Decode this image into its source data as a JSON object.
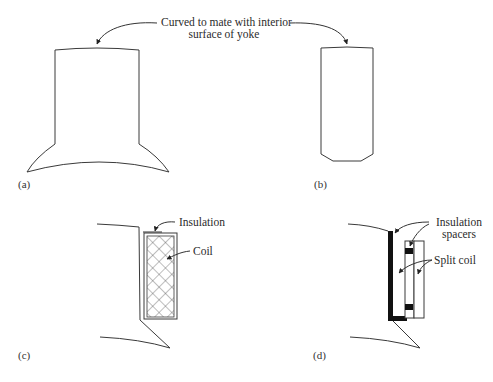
{
  "figure": {
    "top_annotation": {
      "line1": "Curved to mate with interior",
      "line2": "surface of yoke"
    },
    "panels": [
      {
        "id": "a",
        "label": "(a)",
        "description": "Solid pole with pole shoe, top curved to mate with yoke"
      },
      {
        "id": "b",
        "label": "(b)",
        "description": "Pole without shoe, chamfered bottom corners"
      },
      {
        "id": "c",
        "label": "(c)",
        "description": "Pole section with insulated coil",
        "annotations": {
          "insulation": "Insulation",
          "coil": "Coil"
        }
      },
      {
        "id": "d",
        "label": "(d)",
        "description": "Pole section with split coil and insulation spacers",
        "annotations": {
          "insulation_line1": "Insulation",
          "insulation_line2": "spacers",
          "split_coil": "Split coil"
        }
      }
    ],
    "colors": {
      "line": "#3a3a3a",
      "fill_dark": "#111111",
      "background": "#ffffff"
    }
  }
}
